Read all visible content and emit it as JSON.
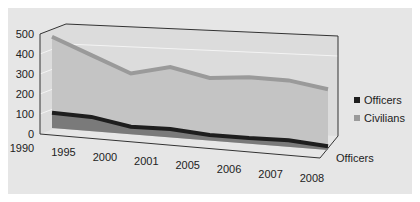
{
  "chart_data": {
    "type": "area",
    "style": "3d",
    "title": "",
    "xlabel": "",
    "ylabel": "",
    "categories": [
      "1990",
      "1995",
      "2000",
      "2001",
      "2005",
      "2006",
      "2007",
      "2008"
    ],
    "series": [
      {
        "name": "Officers",
        "color": "#1e1e1e",
        "values": [
          80,
          75,
          40,
          45,
          30,
          30,
          35,
          20
        ]
      },
      {
        "name": "Civilians",
        "color": "#9a9a9a",
        "values": [
          480,
          400,
          320,
          370,
          330,
          350,
          350,
          320
        ]
      }
    ],
    "ylim": [
      0,
      500
    ],
    "yticks": [
      "0",
      "100",
      "200",
      "300",
      "400",
      "500"
    ],
    "depth_axis_label": "Officers",
    "legend": {
      "position": "right",
      "entries": [
        "Officers",
        "Civilians"
      ]
    },
    "grid": true
  }
}
